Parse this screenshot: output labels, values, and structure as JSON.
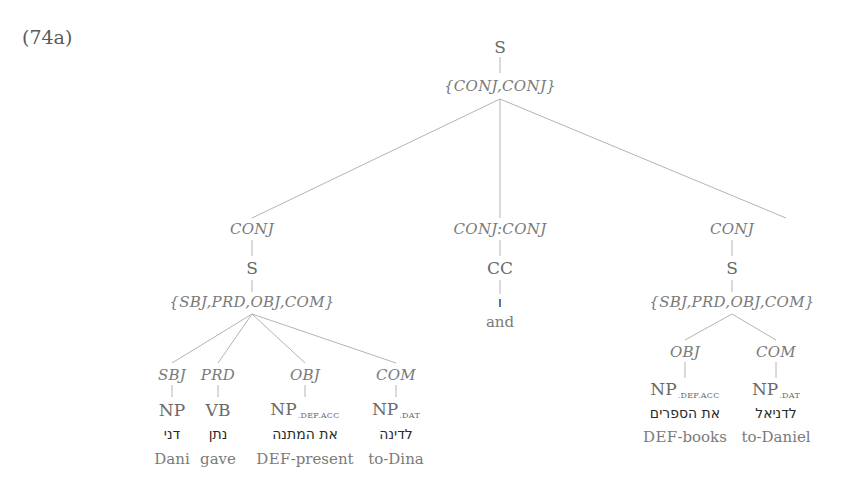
{
  "example_label": "(74a)",
  "tree": {
    "root": {
      "category": "S",
      "functions": "{CONJ,CONJ}"
    },
    "conjuncts": [
      {
        "function": "CONJ",
        "category": "S",
        "functions": "{SBJ,PRD,OBJ,COM}",
        "children": [
          {
            "function": "SBJ",
            "category": "NP",
            "subscript": "",
            "hebrew": "דני",
            "gloss_prefix": "",
            "gloss": "Dani"
          },
          {
            "function": "PRD",
            "category": "VB",
            "subscript": "",
            "hebrew": "נתן",
            "gloss_prefix": "",
            "gloss": "gave"
          },
          {
            "function": "OBJ",
            "category": "NP",
            "subscript": ".DEF.ACC",
            "hebrew": "את המתנה",
            "gloss_prefix": "DEF",
            "gloss": "-present"
          },
          {
            "function": "COM",
            "category": "NP",
            "subscript": ".DAT",
            "hebrew": "לדינה",
            "gloss_prefix": "",
            "gloss": "to-Dina"
          }
        ]
      },
      {
        "function": "CONJ:CONJ",
        "category": "CC",
        "hebrew": "ו",
        "gloss": "and"
      },
      {
        "function": "CONJ",
        "category": "S",
        "functions": "{SBJ,PRD,OBJ,COM}",
        "children": [
          {
            "function": "OBJ",
            "category": "NP",
            "subscript": ".DEF.ACC",
            "hebrew": "את הספרים",
            "gloss_prefix": "DEF",
            "gloss": "-books"
          },
          {
            "function": "COM",
            "category": "NP",
            "subscript": ".DAT",
            "hebrew": "לדניאל",
            "gloss_prefix": "",
            "gloss": "to-Daniel"
          }
        ]
      }
    ]
  },
  "colors": {
    "edge": "#b4b4b4",
    "label": "#6a6a6a",
    "hebrew": "#2a2a2a"
  }
}
